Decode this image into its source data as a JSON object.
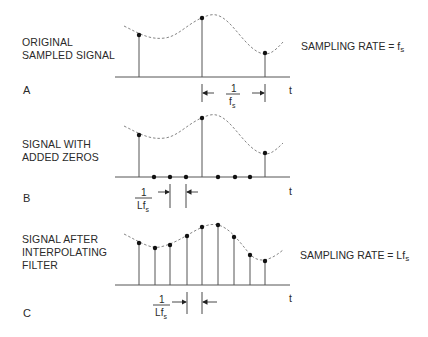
{
  "panels": [
    {
      "letter": "A",
      "label_lines": [
        "ORIGINAL",
        "SAMPLED SIGNAL"
      ],
      "rate_text": "SAMPLING RATE = f",
      "rate_sub": "s",
      "interval_label": {
        "num": "1",
        "den": "f",
        "den_sub": "s"
      },
      "axis_label": "t"
    },
    {
      "letter": "B",
      "label_lines": [
        "SIGNAL WITH",
        "ADDED ZEROS"
      ],
      "interval_label": {
        "num": "1",
        "den": "Lf",
        "den_sub": "s"
      },
      "axis_label": "t"
    },
    {
      "letter": "C",
      "label_lines": [
        "SIGNAL AFTER",
        "INTERPOLATING",
        "FILTER"
      ],
      "rate_text": "SAMPLING RATE = Lf",
      "rate_sub": "s",
      "interval_label": {
        "num": "1",
        "den": "Lf",
        "den_sub": "s"
      },
      "axis_label": "t"
    }
  ],
  "colors": {
    "line": "#555555",
    "dot": "#111111",
    "curve": "#777777"
  }
}
